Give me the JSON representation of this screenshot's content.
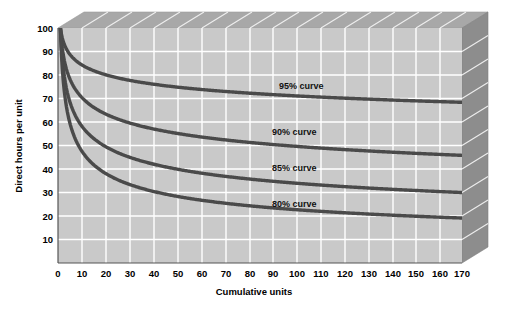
{
  "chart_data": {
    "type": "line",
    "title": "",
    "xlabel": "Cumulative units",
    "ylabel": "Direct hours per unit",
    "xlim": [
      0,
      170
    ],
    "ylim": [
      0,
      100
    ],
    "xticks": [
      0,
      10,
      20,
      30,
      40,
      50,
      60,
      70,
      80,
      90,
      100,
      110,
      120,
      130,
      140,
      150,
      160,
      170
    ],
    "yticks": [
      10,
      20,
      30,
      40,
      50,
      60,
      70,
      80,
      90,
      100
    ],
    "grid": true,
    "legend_position": "inline-annotations",
    "style": {
      "plot_background": "#c9c9c9",
      "grid_color": "#ffffff",
      "curve_color": "#4a4a4a",
      "top_face": "#a8a8a8",
      "right_face": "#8d8d8d",
      "page_background": "#ffffff"
    },
    "series": [
      {
        "name": "95% curve",
        "rate": 0.95,
        "label": "95% curve",
        "label_x": 73,
        "label_y": 79,
        "x": [
          1,
          2,
          5,
          10,
          20,
          30,
          40,
          50,
          60,
          70,
          80,
          90,
          100,
          110,
          120,
          130,
          140,
          150,
          160,
          170
        ],
        "values": [
          100,
          95,
          89.2,
          84.8,
          80.5,
          78.1,
          76.5,
          75.2,
          74.2,
          73.4,
          72.7,
          72.1,
          71.5,
          71.1,
          70.6,
          70.2,
          69.8,
          69.5,
          69.2,
          68.9
        ]
      },
      {
        "name": "90% curve",
        "rate": 0.9,
        "label": "90% curve",
        "label_x": 70,
        "label_y": 58,
        "x": [
          1,
          2,
          5,
          10,
          20,
          30,
          40,
          50,
          60,
          70,
          80,
          90,
          100,
          110,
          120,
          130,
          140,
          150,
          160,
          170
        ],
        "values": [
          100,
          90,
          78.3,
          70.5,
          63.4,
          59.6,
          57.1,
          55.2,
          53.7,
          52.5,
          51.4,
          50.6,
          49.8,
          49.1,
          48.5,
          47.9,
          47.4,
          46.9,
          46.5,
          46.1
        ]
      },
      {
        "name": "85% curve",
        "rate": 0.85,
        "label": "85% curve",
        "label_x": 70,
        "label_y": 38,
        "x": [
          1,
          2,
          5,
          10,
          20,
          30,
          40,
          50,
          60,
          70,
          80,
          90,
          100,
          110,
          120,
          130,
          140,
          150,
          160,
          170
        ],
        "values": [
          100,
          85,
          68.4,
          58.1,
          49.4,
          45.0,
          42.0,
          39.9,
          38.2,
          36.9,
          35.7,
          34.8,
          33.9,
          33.2,
          32.5,
          31.9,
          31.4,
          30.9,
          30.4,
          30.0
        ]
      },
      {
        "name": "80% curve",
        "rate": 0.8,
        "label": "80% curve",
        "label_x": 70,
        "label_y": 22,
        "x": [
          1,
          2,
          5,
          10,
          20,
          30,
          40,
          50,
          60,
          70,
          80,
          90,
          100,
          110,
          120,
          130,
          140,
          150,
          160,
          170
        ],
        "values": [
          100,
          80,
          59.6,
          47.7,
          38.1,
          33.0,
          30.5,
          28.1,
          26.4,
          25.1,
          24.0,
          23.1,
          22.3,
          21.6,
          21.0,
          20.5,
          20.0,
          19.6,
          19.2,
          18.8
        ]
      }
    ]
  }
}
